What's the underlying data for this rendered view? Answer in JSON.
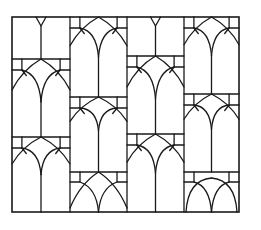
{
  "figure": {
    "title": "",
    "stroke_color": "#1a1a1a",
    "background_color": "#ffffff",
    "frame": {
      "x0": 12,
      "y0": 17,
      "x1": 239,
      "y1": 212
    },
    "columns": [
      {
        "x0": 12,
        "x1": 70,
        "row_lines": [
          59,
          137
        ],
        "bottom_style": "pointed"
      },
      {
        "x0": 70,
        "x1": 127,
        "row_lines": [
          97,
          172
        ],
        "bottom_style": "pointed-cross"
      },
      {
        "x0": 127,
        "x1": 184,
        "row_lines": [
          56,
          134
        ],
        "bottom_style": "pointed"
      },
      {
        "x0": 184,
        "x1": 239,
        "row_lines": [
          94,
          172
        ],
        "bottom_style": "round-double"
      }
    ]
  }
}
